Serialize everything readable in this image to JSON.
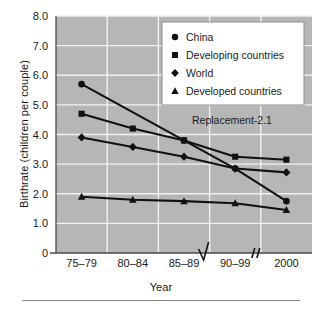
{
  "chart_data": {
    "type": "line",
    "title": "",
    "xlabel": "Year",
    "ylabel": "Birthrate (children per couple)",
    "categories": [
      "75–79",
      "80–84",
      "85–89",
      "90–99",
      "2000"
    ],
    "ylim": [
      0,
      8.0
    ],
    "yticks": [
      "0",
      "1.0",
      "2.0",
      "3.0",
      "4.0",
      "5.0",
      "6.0",
      "7.0",
      "8.0"
    ],
    "ytick_values": [
      0,
      1.0,
      2.0,
      3.0,
      4.0,
      5.0,
      6.0,
      7.0,
      8.0
    ],
    "grid": true,
    "grid_color": "#f2f2f2",
    "plot_background": "#b6b6b6",
    "series_color": "#111111",
    "legend_position": "top-right",
    "series": [
      {
        "name": "China",
        "marker": "circle",
        "values": [
          5.7,
          null,
          3.8,
          2.85,
          1.75
        ]
      },
      {
        "name": "Developing countries",
        "marker": "square",
        "values": [
          4.7,
          4.2,
          3.8,
          3.25,
          3.15
        ]
      },
      {
        "name": "World",
        "marker": "diamond",
        "values": [
          3.9,
          3.58,
          3.25,
          2.85,
          2.72
        ]
      },
      {
        "name": "Developed countries",
        "marker": "triangle",
        "values": [
          1.9,
          1.8,
          1.75,
          1.68,
          1.45
        ]
      }
    ],
    "annotations": [
      {
        "text": "Replacement-2.1",
        "x_category": "85–89",
        "y": 4.35
      }
    ],
    "axis_breaks": [
      {
        "symbol": "zigzag",
        "between": [
          "85–89",
          "90–99"
        ]
      },
      {
        "symbol": "double-slash",
        "between": [
          "90–99",
          "2000"
        ]
      }
    ]
  },
  "legend": {
    "entries": [
      {
        "label": "China",
        "marker": "circle"
      },
      {
        "label": "Developing countries",
        "marker": "square"
      },
      {
        "label": "World",
        "marker": "diamond"
      },
      {
        "label": "Developed countries",
        "marker": "triangle"
      }
    ]
  }
}
